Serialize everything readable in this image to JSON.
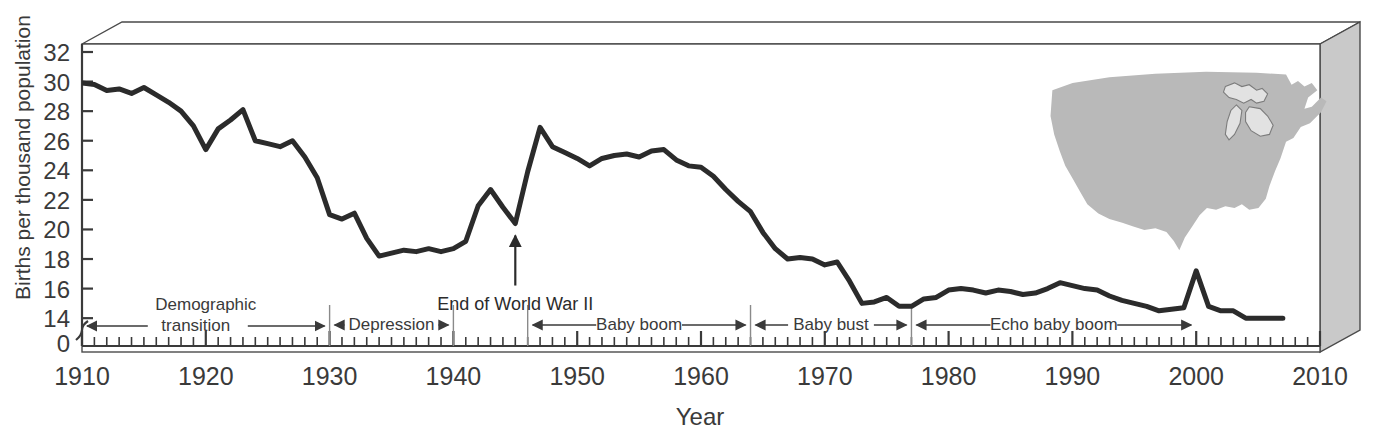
{
  "chart_data": {
    "type": "line",
    "title": "",
    "xlabel": "Year",
    "ylabel": "Births per thousand population",
    "xlim": [
      1910,
      2010
    ],
    "ylim": [
      13,
      32
    ],
    "y_axis_break": true,
    "y_zero_label": "0",
    "grid": false,
    "legend": "none",
    "x_ticks_major": [
      1910,
      1920,
      1930,
      1940,
      1950,
      1960,
      1970,
      1980,
      1990,
      2000,
      2010
    ],
    "x_tick_labels": [
      "1910",
      "1920",
      "1930",
      "1940",
      "1950",
      "1960",
      "1970",
      "1980",
      "1990",
      "2000",
      "2010"
    ],
    "x_tick_minor_interval": 1,
    "y_ticks": [
      0,
      14,
      16,
      18,
      20,
      22,
      24,
      26,
      28,
      30,
      32
    ],
    "y_tick_labels": [
      "0",
      "14",
      "16",
      "18",
      "20",
      "22",
      "24",
      "26",
      "28",
      "30",
      "32"
    ],
    "series": [
      {
        "name": "US birth rate",
        "color": "#2b2b2b",
        "x": [
          1910,
          1911,
          1912,
          1913,
          1914,
          1915,
          1916,
          1917,
          1918,
          1919,
          1920,
          1921,
          1922,
          1923,
          1924,
          1925,
          1926,
          1927,
          1928,
          1929,
          1930,
          1931,
          1932,
          1933,
          1934,
          1935,
          1936,
          1937,
          1938,
          1939,
          1940,
          1941,
          1942,
          1943,
          1944,
          1945,
          1946,
          1947,
          1948,
          1949,
          1950,
          1951,
          1952,
          1953,
          1954,
          1955,
          1956,
          1957,
          1958,
          1959,
          1960,
          1961,
          1962,
          1963,
          1964,
          1965,
          1966,
          1967,
          1968,
          1969,
          1970,
          1971,
          1972,
          1973,
          1974,
          1975,
          1976,
          1977,
          1978,
          1979,
          1980,
          1981,
          1982,
          1983,
          1984,
          1985,
          1986,
          1987,
          1988,
          1989,
          1990,
          1991,
          1992,
          1993,
          1994,
          1995,
          1996,
          1997,
          1998,
          1999,
          2000,
          2001,
          2002,
          2003,
          2004,
          2005,
          2006,
          2007
        ],
        "y": [
          29.9,
          29.8,
          29.4,
          29.5,
          29.2,
          29.6,
          29.1,
          28.6,
          28.0,
          27.0,
          25.4,
          26.8,
          27.4,
          28.1,
          26.0,
          25.8,
          25.6,
          26.0,
          24.9,
          23.5,
          21.0,
          20.7,
          21.1,
          19.4,
          18.2,
          18.4,
          18.6,
          18.5,
          18.7,
          18.5,
          18.7,
          19.2,
          21.6,
          22.7,
          21.5,
          20.4,
          23.9,
          26.9,
          25.6,
          25.2,
          24.8,
          24.3,
          24.8,
          25.0,
          25.1,
          24.9,
          25.3,
          25.4,
          24.7,
          24.3,
          24.2,
          23.6,
          22.7,
          21.9,
          21.2,
          19.8,
          18.7,
          18.0,
          18.1,
          18.0,
          17.6,
          17.8,
          16.5,
          15.0,
          15.1,
          15.4,
          14.8,
          14.8,
          15.3,
          15.4,
          15.9,
          16.0,
          15.9,
          15.7,
          15.9,
          15.8,
          15.6,
          15.7,
          16.0,
          16.4,
          16.2,
          16.0,
          15.9,
          15.5,
          15.2,
          15.0,
          14.8,
          14.5,
          14.6,
          14.7,
          17.2,
          14.8,
          14.5,
          14.5,
          14.0,
          14.0,
          14.0,
          14.0
        ]
      }
    ],
    "annotations": [
      {
        "name": "end-of-wwii",
        "label": "End of World War II",
        "x": 1945,
        "y": 20.4,
        "kind": "arrow-up"
      }
    ],
    "eras": [
      {
        "name": "demographic-transition",
        "label": "Demographic\ntransition",
        "label_line1": "Demographic",
        "label_line2": "transition",
        "start": 1910,
        "end": 1930
      },
      {
        "name": "depression",
        "label": "Depression",
        "start": 1930,
        "end": 1940
      },
      {
        "name": "baby-boom",
        "label": "Baby boom",
        "start": 1946,
        "end": 1964
      },
      {
        "name": "baby-bust",
        "label": "Baby bust",
        "start": 1964,
        "end": 1977
      },
      {
        "name": "echo-baby-boom",
        "label": "Echo baby boom",
        "start": 1977,
        "end": 2000
      }
    ],
    "era_dividers": [
      1930,
      1940,
      1946,
      1964,
      1977
    ],
    "inset": {
      "name": "united-states-map",
      "kind": "map-silhouette",
      "region": "United States",
      "fill": "#b9b9b9",
      "stroke": "#8c8c8c",
      "features": [
        "Great Lakes outline"
      ]
    },
    "frame": {
      "style": "3d-box",
      "panel_fill": "#ffffff",
      "side_fill": "#c9c9c9",
      "top_fill": "#ffffff",
      "stroke": "#4a4a4a"
    },
    "line_color": "#2b2b2b",
    "line_width": 5
  }
}
